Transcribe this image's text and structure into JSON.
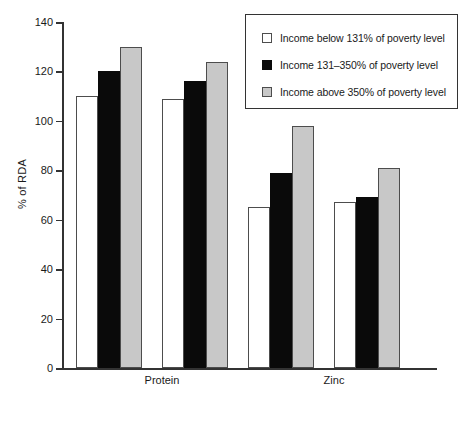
{
  "chart_data": {
    "type": "bar",
    "title": "",
    "xlabel": "",
    "ylabel": "% of RDA",
    "ylim": [
      0,
      140
    ],
    "yticks": [
      0,
      20,
      40,
      60,
      80,
      100,
      120,
      140
    ],
    "grid": false,
    "legend_position": "top-right",
    "categories": [
      "Men",
      "Women",
      "Men",
      "Women"
    ],
    "groups": [
      {
        "name": "Protein",
        "categories": [
          "Men",
          "Women"
        ]
      },
      {
        "name": "Zinc",
        "categories": [
          "Men",
          "Women"
        ]
      }
    ],
    "series": [
      {
        "name": "Income below 131% of poverty level",
        "color": "#ffffff",
        "values": [
          110,
          109,
          65,
          67
        ]
      },
      {
        "name": "Income 131–350% of poverty level",
        "color": "#0a0a0a",
        "values": [
          120,
          116,
          79,
          69
        ]
      },
      {
        "name": "Income above 350% of poverty level",
        "color": "#c8c8c8",
        "values": [
          130,
          124,
          98,
          81
        ]
      }
    ]
  },
  "axis": {
    "y_label": "% of RDA",
    "y_ticks": [
      "0",
      "20",
      "40",
      "60",
      "80",
      "100",
      "120",
      "140"
    ]
  },
  "x_axis": {
    "category_labels": [
      "Men",
      "Women",
      "Men",
      "Women"
    ],
    "group_labels": [
      "Protein",
      "Zinc"
    ]
  },
  "legend": {
    "items": [
      {
        "label": "Income below 131% of poverty level",
        "swatch": "white-square"
      },
      {
        "label": "Income 131–350% of poverty level",
        "swatch": "black-square"
      },
      {
        "label": "Income above 350% of poverty level",
        "swatch": "gray-square"
      }
    ]
  },
  "colors": {
    "series_0": "#ffffff",
    "series_1": "#0a0a0a",
    "series_2": "#c8c8c8",
    "axis": "#333333",
    "outline": "#4d4d4d"
  }
}
